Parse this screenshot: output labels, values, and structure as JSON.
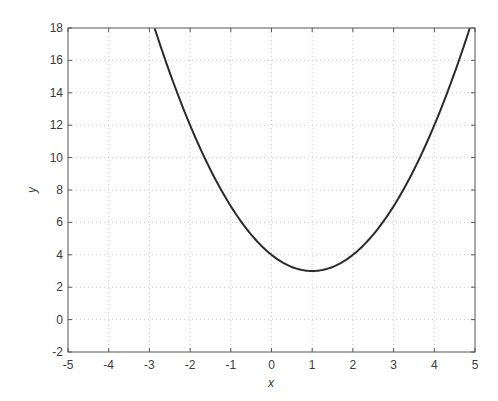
{
  "chart_data": {
    "type": "line",
    "title": "",
    "xlabel": "x",
    "ylabel": "y",
    "xlim": [
      -5,
      5
    ],
    "ylim": [
      -2,
      18
    ],
    "xticks": [
      -5,
      -4,
      -3,
      -2,
      -1,
      0,
      1,
      2,
      3,
      4,
      5
    ],
    "yticks": [
      -2,
      0,
      2,
      4,
      6,
      8,
      10,
      12,
      14,
      16,
      18
    ],
    "grid": true,
    "legend": null,
    "series": [
      {
        "name": "y = (x-1)^2 + 3",
        "color": "#2b2b2b",
        "x": [
          -2.87,
          -2.5,
          -2,
          -1.5,
          -1,
          -0.5,
          0,
          0.5,
          1,
          1.5,
          2,
          2.5,
          3,
          3.5,
          4,
          4.5,
          4.87
        ],
        "y": [
          18.0,
          15.25,
          12,
          9.25,
          7,
          5.25,
          4,
          3.25,
          3,
          3.25,
          4,
          5.25,
          7,
          9.25,
          12,
          15.25,
          18.0
        ]
      }
    ],
    "annotations": []
  },
  "colors": {
    "axis": "#555555",
    "grid": "#c8c8c8",
    "line": "#2b2b2b",
    "text": "#3a3a3a"
  }
}
